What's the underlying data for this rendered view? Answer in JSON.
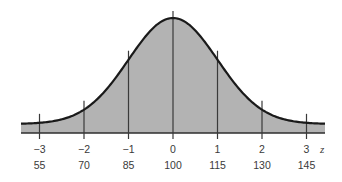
{
  "chart_data": {
    "type": "area",
    "title": "",
    "xlabel": "z",
    "ylabel": "",
    "mean": 100,
    "sd": 15,
    "z_ticks": [
      "−3",
      "−2",
      "−1",
      "0",
      "1",
      "2",
      "3"
    ],
    "z_values": [
      -3,
      -2,
      -1,
      0,
      1,
      2,
      3
    ],
    "score_ticks": [
      "55",
      "70",
      "85",
      "100",
      "115",
      "130",
      "145"
    ],
    "score_values": [
      55,
      70,
      85,
      100,
      115,
      130,
      145
    ],
    "xlim_z": [
      -3.4,
      3.4
    ],
    "grid": false,
    "legend": null,
    "colors": {
      "fill": "#b3b3b3",
      "curve": "#1a1a1a",
      "lines": "#3a3a3a",
      "text": "#3a3a3a"
    }
  }
}
